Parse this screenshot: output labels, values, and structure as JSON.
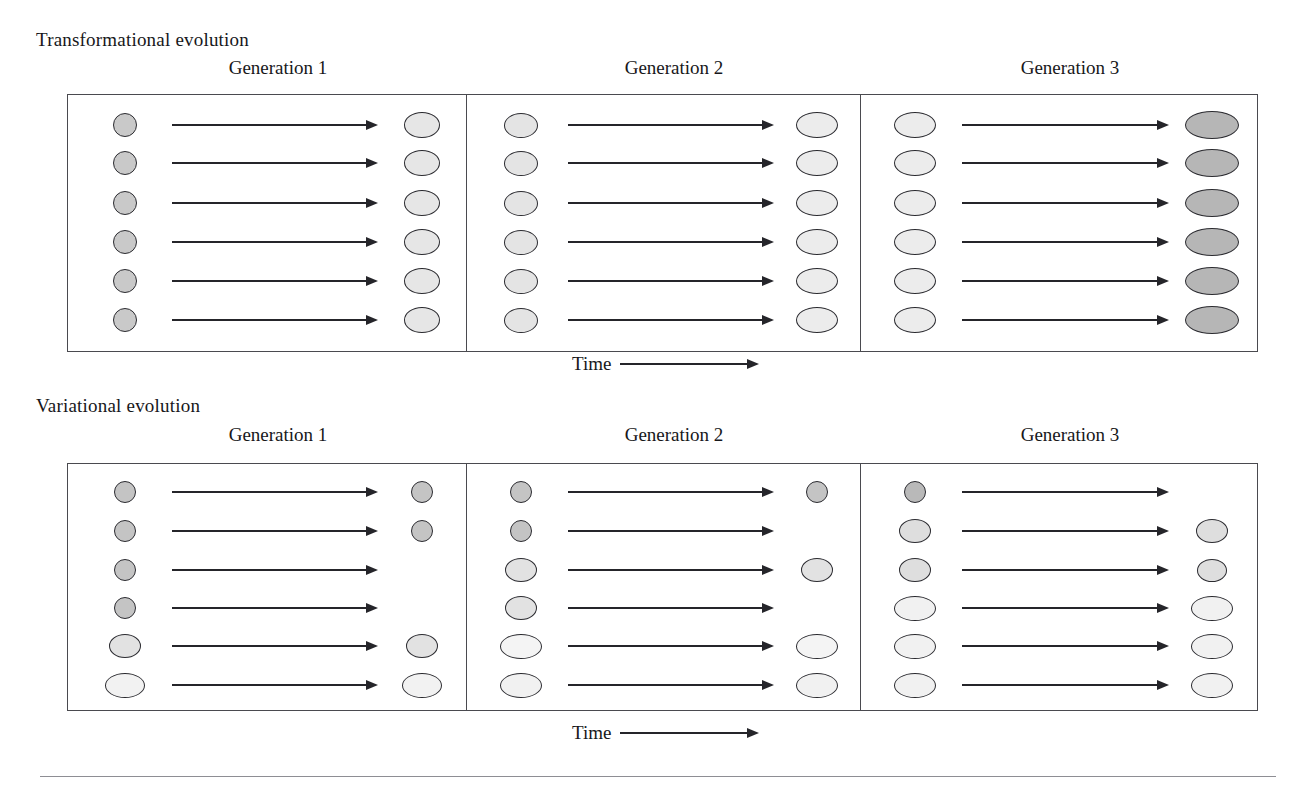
{
  "figure": {
    "time_label": "Time",
    "generation_labels": [
      "Generation 1",
      "Generation 2",
      "Generation 3"
    ]
  },
  "sections": [
    {
      "id": "transformational",
      "title": "Transformational evolution",
      "panels": [
        {
          "generation": "Generation 1",
          "left_shapes": [
            {
              "w": 24,
              "h": 24,
              "fill": "#c9c9c9"
            },
            {
              "w": 24,
              "h": 24,
              "fill": "#c9c9c9"
            },
            {
              "w": 24,
              "h": 24,
              "fill": "#c9c9c9"
            },
            {
              "w": 24,
              "h": 24,
              "fill": "#c9c9c9"
            },
            {
              "w": 24,
              "h": 24,
              "fill": "#c9c9c9"
            },
            {
              "w": 24,
              "h": 24,
              "fill": "#c9c9c9"
            }
          ],
          "right_shapes": [
            {
              "w": 36,
              "h": 26,
              "fill": "#e6e6e6"
            },
            {
              "w": 36,
              "h": 26,
              "fill": "#e6e6e6"
            },
            {
              "w": 36,
              "h": 26,
              "fill": "#e6e6e6"
            },
            {
              "w": 36,
              "h": 26,
              "fill": "#e6e6e6"
            },
            {
              "w": 36,
              "h": 26,
              "fill": "#e6e6e6"
            },
            {
              "w": 36,
              "h": 26,
              "fill": "#e6e6e6"
            }
          ]
        },
        {
          "generation": "Generation 2",
          "left_shapes": [
            {
              "w": 34,
              "h": 25,
              "fill": "#e4e4e4"
            },
            {
              "w": 34,
              "h": 25,
              "fill": "#e4e4e4"
            },
            {
              "w": 34,
              "h": 25,
              "fill": "#e4e4e4"
            },
            {
              "w": 34,
              "h": 25,
              "fill": "#e4e4e4"
            },
            {
              "w": 34,
              "h": 25,
              "fill": "#e4e4e4"
            },
            {
              "w": 34,
              "h": 25,
              "fill": "#e4e4e4"
            }
          ],
          "right_shapes": [
            {
              "w": 42,
              "h": 26,
              "fill": "#ececec"
            },
            {
              "w": 42,
              "h": 26,
              "fill": "#ececec"
            },
            {
              "w": 42,
              "h": 26,
              "fill": "#ececec"
            },
            {
              "w": 42,
              "h": 26,
              "fill": "#ececec"
            },
            {
              "w": 42,
              "h": 26,
              "fill": "#ececec"
            },
            {
              "w": 42,
              "h": 26,
              "fill": "#ececec"
            }
          ]
        },
        {
          "generation": "Generation 3",
          "left_shapes": [
            {
              "w": 42,
              "h": 26,
              "fill": "#ececec"
            },
            {
              "w": 42,
              "h": 26,
              "fill": "#ececec"
            },
            {
              "w": 42,
              "h": 26,
              "fill": "#ececec"
            },
            {
              "w": 42,
              "h": 26,
              "fill": "#ececec"
            },
            {
              "w": 42,
              "h": 26,
              "fill": "#ececec"
            },
            {
              "w": 42,
              "h": 26,
              "fill": "#ececec"
            }
          ],
          "right_shapes": [
            {
              "w": 54,
              "h": 28,
              "fill": "#b6b6b6"
            },
            {
              "w": 54,
              "h": 28,
              "fill": "#b6b6b6"
            },
            {
              "w": 54,
              "h": 28,
              "fill": "#b6b6b6"
            },
            {
              "w": 54,
              "h": 28,
              "fill": "#b6b6b6"
            },
            {
              "w": 54,
              "h": 28,
              "fill": "#b6b6b6"
            },
            {
              "w": 54,
              "h": 28,
              "fill": "#b6b6b6"
            }
          ]
        }
      ]
    },
    {
      "id": "variational",
      "title": "Variational evolution",
      "panels": [
        {
          "generation": "Generation 1",
          "left_shapes": [
            {
              "w": 22,
              "h": 22,
              "fill": "#c4c4c4"
            },
            {
              "w": 22,
              "h": 22,
              "fill": "#c4c4c4"
            },
            {
              "w": 22,
              "h": 22,
              "fill": "#c4c4c4"
            },
            {
              "w": 22,
              "h": 22,
              "fill": "#c4c4c4"
            },
            {
              "w": 32,
              "h": 24,
              "fill": "#e2e2e2"
            },
            {
              "w": 40,
              "h": 25,
              "fill": "#f2f2f2"
            }
          ],
          "right_shapes": [
            {
              "w": 22,
              "h": 22,
              "fill": "#c4c4c4"
            },
            {
              "w": 22,
              "h": 22,
              "fill": "#c4c4c4"
            },
            null,
            null,
            {
              "w": 32,
              "h": 24,
              "fill": "#e2e2e2"
            },
            {
              "w": 40,
              "h": 25,
              "fill": "#f2f2f2"
            }
          ]
        },
        {
          "generation": "Generation 2",
          "left_shapes": [
            {
              "w": 22,
              "h": 22,
              "fill": "#c4c4c4"
            },
            {
              "w": 22,
              "h": 22,
              "fill": "#c4c4c4"
            },
            {
              "w": 32,
              "h": 24,
              "fill": "#e2e2e2"
            },
            {
              "w": 32,
              "h": 24,
              "fill": "#e2e2e2"
            },
            {
              "w": 42,
              "h": 25,
              "fill": "#f4f4f4"
            },
            {
              "w": 42,
              "h": 25,
              "fill": "#f1f1f1"
            }
          ],
          "right_shapes": [
            {
              "w": 22,
              "h": 22,
              "fill": "#c4c4c4"
            },
            null,
            {
              "w": 32,
              "h": 24,
              "fill": "#e2e2e2"
            },
            null,
            {
              "w": 42,
              "h": 25,
              "fill": "#f4f4f4"
            },
            {
              "w": 42,
              "h": 25,
              "fill": "#f1f1f1"
            }
          ]
        },
        {
          "generation": "Generation 3",
          "left_shapes": [
            {
              "w": 22,
              "h": 22,
              "fill": "#b9b9b9"
            },
            {
              "w": 32,
              "h": 24,
              "fill": "#dedede"
            },
            {
              "w": 32,
              "h": 24,
              "fill": "#dedede"
            },
            {
              "w": 42,
              "h": 25,
              "fill": "#f1f1f1"
            },
            {
              "w": 42,
              "h": 25,
              "fill": "#f1f1f1"
            },
            {
              "w": 42,
              "h": 25,
              "fill": "#f1f1f1"
            }
          ],
          "right_shapes": [
            null,
            {
              "w": 32,
              "h": 24,
              "fill": "#dedede"
            },
            {
              "w": 30,
              "h": 23,
              "fill": "#dedede"
            },
            {
              "w": 42,
              "h": 25,
              "fill": "#f1f1f1"
            },
            {
              "w": 42,
              "h": 25,
              "fill": "#f1f1f1"
            },
            {
              "w": 42,
              "h": 25,
              "fill": "#f1f1f1"
            }
          ]
        }
      ]
    }
  ]
}
